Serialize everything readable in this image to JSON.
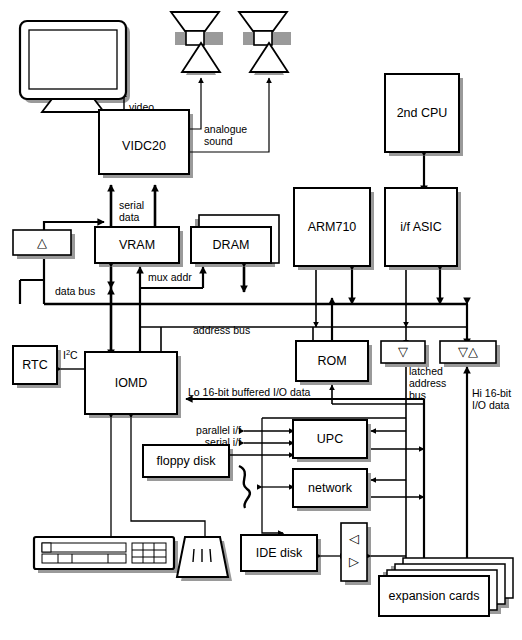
{
  "diagram": {
    "blocks": {
      "vidc20": "VIDC20",
      "vram": "VRAM",
      "dram": "DRAM",
      "arm710": "ARM710",
      "if_asic": "i/f ASIC",
      "second_cpu": "2nd CPU",
      "iomd": "IOMD",
      "rtc": "RTC",
      "rom": "ROM",
      "upc": "UPC",
      "network": "network",
      "floppy_disk": "floppy disk",
      "ide_disk": "IDE disk",
      "expansion_cards": "expansion cards",
      "buffer_vram_tri": "△",
      "buffer_latched_tri": "▽",
      "buffer_hi_io_tri": "▽△",
      "buffer_ide_tri_top": "◁",
      "buffer_ide_tri_bottom": "▷"
    },
    "labels": {
      "video": "video",
      "analogue_sound_l1": "analogue",
      "analogue_sound_l2": "sound",
      "serial_l1": "serial",
      "serial_l2": "data",
      "mux_addr": "mux addr",
      "data_bus": "data bus",
      "address_bus": "address bus",
      "i2c_main": "I",
      "i2c_sup": "2",
      "i2c_tail": "C",
      "lo_io": "Lo 16-bit buffered I/O data",
      "parallel_if": "parallel i/f",
      "serial_if": "serial i/f",
      "latched_l1": "latched",
      "latched_l2": "address",
      "latched_l3": "bus",
      "hi_io_l1": "Hi 16-bit",
      "hi_io_l2": "I/O data"
    },
    "peripherals": {
      "monitor": "monitor",
      "speaker_left": "speaker",
      "speaker_right": "speaker",
      "amp_left": "amplifier",
      "amp_right": "amplifier",
      "keyboard": "keyboard",
      "mouse": "mouse",
      "network_cable": "network-cable"
    },
    "colors": {
      "stroke": "#000000",
      "fill": "#ffffff",
      "shadow": "#9a9a9a",
      "background": "#ffffff"
    }
  }
}
